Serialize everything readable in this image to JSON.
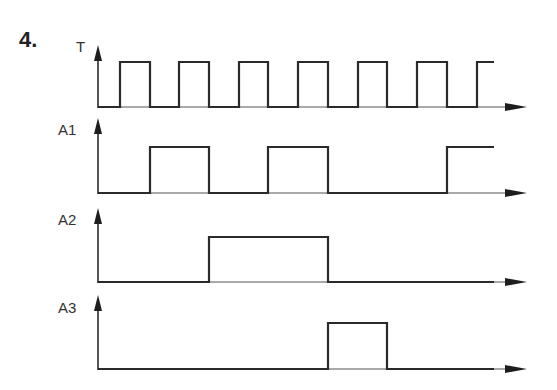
{
  "problem_number": "4.",
  "chart_data": {
    "type": "timing-diagram",
    "title": "4.",
    "x_axis": {
      "start": 98,
      "end": 527,
      "arrow": true
    },
    "signals": [
      {
        "name": "T",
        "label_pos": [
          76,
          52
        ],
        "axis_top": 45,
        "high_y": 62,
        "low_y": 107,
        "edges": [
          98,
          120,
          150,
          179,
          209,
          239,
          268,
          298,
          328,
          358,
          387,
          417,
          447,
          477
        ],
        "start_level": 0,
        "end_x": 494,
        "description": "Clock: 7 pulses, ends high"
      },
      {
        "name": "A1",
        "label_pos": [
          58,
          135
        ],
        "axis_top": 118,
        "high_y": 147,
        "low_y": 193,
        "edges": [
          98,
          150,
          209,
          268,
          328,
          447
        ],
        "start_level": 0,
        "end_x": 494,
        "description": "Toggles on falling edges of T (divide-by-2), held low 328-447, ends high"
      },
      {
        "name": "A2",
        "label_pos": [
          58,
          225
        ],
        "axis_top": 208,
        "high_y": 237,
        "low_y": 282,
        "edges": [
          98,
          209,
          328
        ],
        "start_level": 0,
        "end_x": 494,
        "description": "High from 209 to 328"
      },
      {
        "name": "A3",
        "label_pos": [
          58,
          313
        ],
        "axis_top": 295,
        "high_y": 323,
        "low_y": 369,
        "edges": [
          98,
          328,
          387
        ],
        "start_level": 0,
        "end_x": 494,
        "description": "High from 328 to 387"
      }
    ],
    "xlabel": "",
    "ylabel": "",
    "grid": false
  }
}
